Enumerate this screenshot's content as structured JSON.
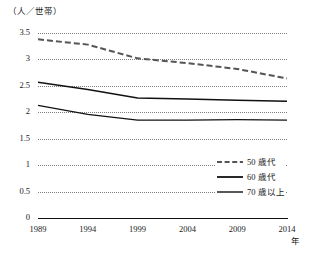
{
  "chart_data": {
    "type": "line",
    "title": "",
    "subtitle": "",
    "ylabel": "（人／世帯）",
    "xlabel": "年",
    "x": [
      1989,
      1994,
      1999,
      2004,
      2009,
      2014
    ],
    "xlim": [
      1989,
      2014
    ],
    "ylim": [
      0,
      3.5
    ],
    "yticks": [
      "0",
      "0.5",
      "1",
      "1.5",
      "2",
      "2.5",
      "3",
      "3.5"
    ],
    "ytick_values": [
      0,
      0.5,
      1,
      1.5,
      2,
      2.5,
      3,
      3.5
    ],
    "xticks": [
      "1989",
      "1994",
      "1999",
      "2004",
      "2009",
      "2014"
    ],
    "grid": true,
    "grid_style": "dotted-horizontal",
    "legend_position": "center-right",
    "series": [
      {
        "name": "50 歳代",
        "style": "dashed",
        "color": "#555555",
        "values": [
          3.38,
          3.28,
          3.02,
          2.93,
          2.82,
          2.64
        ]
      },
      {
        "name": "60 歳代",
        "style": "solid",
        "color": "#111111",
        "values": [
          2.57,
          2.43,
          2.27,
          2.25,
          2.23,
          2.21
        ]
      },
      {
        "name": "70 歳以上",
        "style": "solid",
        "color": "#111111",
        "values": [
          2.13,
          1.96,
          1.85,
          1.85,
          1.86,
          1.85
        ]
      }
    ]
  },
  "axis": {
    "unit_label": "（人／世帯）",
    "x_unit_label": "年"
  },
  "legend": {
    "items": [
      {
        "label": "50 歳代"
      },
      {
        "label": "60 歳代"
      },
      {
        "label": "70 歳以上"
      }
    ]
  }
}
